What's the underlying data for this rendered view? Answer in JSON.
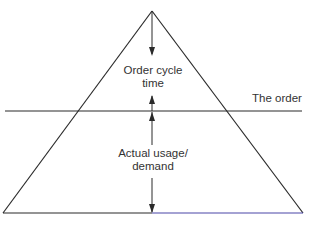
{
  "diagram": {
    "type": "pyramid-order-cycle",
    "labels": {
      "order_cycle": [
        "Order cycle",
        "time"
      ],
      "the_order": "The order",
      "actual_usage": [
        "Actual usage/",
        "demand"
      ]
    },
    "colors": {
      "stroke": "#2a2a2a",
      "base_right": "#4a47a8",
      "text": "#333333"
    },
    "geometry": {
      "apex": [
        152,
        11
      ],
      "base_left": [
        3,
        213
      ],
      "base_right": [
        303,
        213
      ],
      "order_line_y": 111,
      "order_line_x": [
        5,
        302
      ],
      "center_x": 152
    }
  }
}
